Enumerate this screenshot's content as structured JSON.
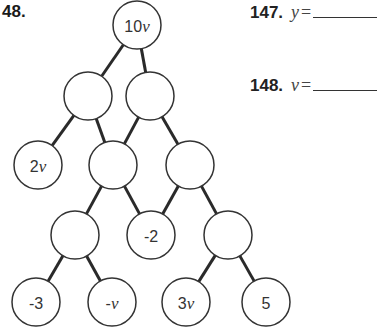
{
  "problem": {
    "number_label": "48."
  },
  "answers": [
    {
      "number": "147.",
      "variable": "y",
      "equals": "="
    },
    {
      "number": "148.",
      "variable": "v",
      "equals": "="
    }
  ],
  "pyramid": {
    "node_radius": 24,
    "nodes": [
      {
        "id": "n0",
        "row": 0,
        "x": 137,
        "y": 25,
        "label": "10v"
      },
      {
        "id": "n1",
        "row": 1,
        "x": 88,
        "y": 96,
        "label": ""
      },
      {
        "id": "n2",
        "row": 1,
        "x": 150,
        "y": 96,
        "label": ""
      },
      {
        "id": "n3",
        "row": 2,
        "x": 38,
        "y": 165,
        "label": "2v"
      },
      {
        "id": "n4",
        "row": 2,
        "x": 113,
        "y": 165,
        "label": ""
      },
      {
        "id": "n5",
        "row": 2,
        "x": 190,
        "y": 165,
        "label": ""
      },
      {
        "id": "n6",
        "row": 3,
        "x": 75,
        "y": 235,
        "label": ""
      },
      {
        "id": "n7",
        "row": 3,
        "x": 151,
        "y": 235,
        "label": "-2"
      },
      {
        "id": "n8",
        "row": 3,
        "x": 228,
        "y": 235,
        "label": ""
      },
      {
        "id": "n9",
        "row": 4,
        "x": 36,
        "y": 302,
        "label": "-3"
      },
      {
        "id": "n10",
        "row": 4,
        "x": 112,
        "y": 302,
        "label": "-v"
      },
      {
        "id": "n11",
        "row": 4,
        "x": 186,
        "y": 302,
        "label": "3v"
      },
      {
        "id": "n12",
        "row": 4,
        "x": 266,
        "y": 302,
        "label": "5"
      }
    ],
    "edges": [
      [
        "n0",
        "n1"
      ],
      [
        "n0",
        "n2"
      ],
      [
        "n1",
        "n3"
      ],
      [
        "n1",
        "n4"
      ],
      [
        "n2",
        "n4"
      ],
      [
        "n2",
        "n5"
      ],
      [
        "n4",
        "n6"
      ],
      [
        "n4",
        "n7"
      ],
      [
        "n5",
        "n7"
      ],
      [
        "n5",
        "n8"
      ],
      [
        "n6",
        "n9"
      ],
      [
        "n6",
        "n10"
      ],
      [
        "n8",
        "n11"
      ],
      [
        "n8",
        "n12"
      ]
    ]
  }
}
